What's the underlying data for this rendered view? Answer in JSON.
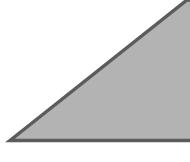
{
  "diagram": {
    "shape": "right-triangle",
    "fill_color": "#b3b3b3",
    "stroke_color": "#5c5c5c",
    "background_color": "#ffffff"
  }
}
